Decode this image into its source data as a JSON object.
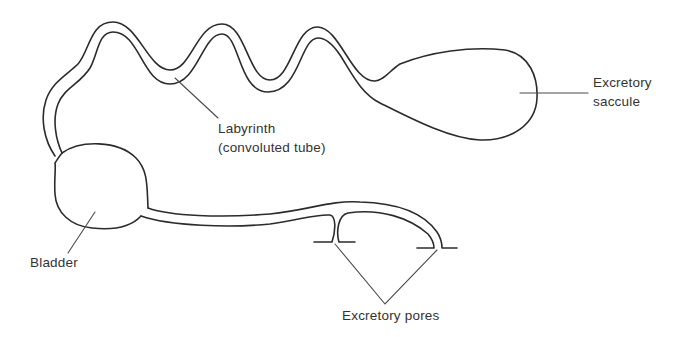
{
  "figure": {
    "stroke_color": "#2b2b2b",
    "background_color": "#ffffff"
  },
  "labels": {
    "labyrinth": {
      "line1": "Labyrinth",
      "line2": "(convoluted tube)"
    },
    "saccule": {
      "line1": "Excretory",
      "line2": "saccule"
    },
    "bladder": {
      "text": "Bladder"
    },
    "pores": {
      "text": "Excretory pores"
    }
  },
  "structures": [
    {
      "name": "excretory-saccule",
      "label": "Excretory saccule"
    },
    {
      "name": "labyrinth",
      "label": "Labyrinth (convoluted tube)"
    },
    {
      "name": "bladder",
      "label": "Bladder"
    },
    {
      "name": "excretory-pores",
      "label": "Excretory pores",
      "count": 2
    }
  ]
}
